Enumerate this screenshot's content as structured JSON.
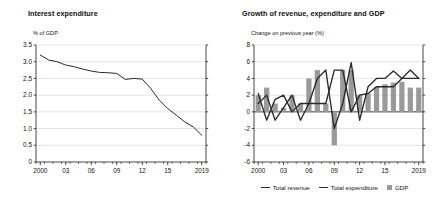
{
  "figure": {
    "background": "#ffffff",
    "line_color": "#2b2b2b",
    "bar_color": "#9a9a9a",
    "grid_color": "#c9c9c9",
    "axis_color": "#1a1a1a"
  },
  "panels": {
    "left": {
      "title": "Interest expenditure",
      "unit_label": "% of GDP"
    },
    "right": {
      "title": "Growth of revenue, expenditure and GDP",
      "unit_label": "Change on previous year (%)",
      "legend": [
        {
          "key": "total-revenue",
          "label": "Total revenue",
          "marker": "line",
          "color": "#2b2b2b"
        },
        {
          "key": "total-expenditure",
          "label": "Total expenditure",
          "marker": "line",
          "color": "#2b2b2b"
        },
        {
          "key": "gdp",
          "label": "GDP",
          "marker": "swatch",
          "color": "#9a9a9a"
        }
      ]
    }
  },
  "chart_data": [
    {
      "type": "line",
      "id": "interest-expenditure",
      "title": "Interest expenditure",
      "xlabel": "",
      "ylabel": "% of GDP",
      "ylim": [
        0,
        3.5
      ],
      "yticks": [
        0,
        0.5,
        1.0,
        1.5,
        2.0,
        2.5,
        3.0,
        3.5
      ],
      "ytick_labels": [
        "0",
        "0.5",
        "1.0",
        "1.5",
        "2.0",
        "2.5",
        "3.0",
        "3.5"
      ],
      "xlim": [
        2000,
        2019
      ],
      "xticks": [
        2000,
        2003,
        2006,
        2009,
        2012,
        2015,
        2019
      ],
      "xtick_labels": [
        "2000",
        "03",
        "06",
        "09",
        "12",
        "15",
        "2019"
      ],
      "grid": true,
      "legend_position": "none",
      "x": [
        2000,
        2001,
        2002,
        2003,
        2004,
        2005,
        2006,
        2007,
        2008,
        2009,
        2010,
        2011,
        2012,
        2013,
        2014,
        2015,
        2016,
        2017,
        2018,
        2019
      ],
      "values": [
        3.2,
        3.05,
        3.0,
        2.9,
        2.85,
        2.78,
        2.72,
        2.68,
        2.67,
        2.65,
        2.47,
        2.5,
        2.48,
        2.2,
        1.85,
        1.6,
        1.4,
        1.2,
        1.05,
        0.8
      ],
      "series": [
        {
          "name": "Interest expenditure",
          "color": "#2b2b2b",
          "values": [
            3.2,
            3.05,
            3.0,
            2.9,
            2.85,
            2.78,
            2.72,
            2.68,
            2.67,
            2.65,
            2.47,
            2.5,
            2.48,
            2.2,
            1.85,
            1.6,
            1.4,
            1.2,
            1.05,
            0.8
          ]
        }
      ]
    },
    {
      "type": "bar",
      "id": "growth-revenue-expenditure-gdp",
      "title": "Growth of revenue, expenditure and GDP",
      "xlabel": "",
      "ylabel": "Change on previous year (%)",
      "ylim": [
        -6,
        8
      ],
      "yticks": [
        -6,
        -4,
        -2,
        0,
        2,
        4,
        6,
        8
      ],
      "ytick_labels": [
        "-6",
        "-4",
        "-2",
        "0",
        "2",
        "4",
        "6",
        "8"
      ],
      "xlim": [
        2000,
        2019
      ],
      "xticks": [
        2000,
        2003,
        2006,
        2009,
        2012,
        2015,
        2019
      ],
      "xtick_labels": [
        "2000",
        "03",
        "06",
        "09",
        "12",
        "15",
        "2019"
      ],
      "categories": [
        2000,
        2001,
        2002,
        2003,
        2004,
        2005,
        2006,
        2007,
        2008,
        2009,
        2010,
        2011,
        2012,
        2013,
        2014,
        2015,
        2016,
        2017,
        2018,
        2019
      ],
      "grid": true,
      "legend_position": "bottom",
      "series": [
        {
          "name": "GDP",
          "type": "bar",
          "color": "#9a9a9a",
          "values": [
            2.0,
            2.9,
            1.0,
            0.5,
            2.0,
            1.0,
            4.0,
            5.0,
            1.0,
            -4.0,
            5.0,
            5.0,
            2.0,
            2.2,
            3.0,
            3.3,
            3.5,
            3.6,
            2.9,
            2.9
          ]
        },
        {
          "name": "Total revenue",
          "type": "line",
          "color": "#2b2b2b",
          "values": [
            1.0,
            2.0,
            -1.0,
            0.5,
            2.0,
            -1.0,
            1.0,
            4.0,
            5.0,
            -2.0,
            1.0,
            5.9,
            -1.0,
            3.0,
            4.0,
            4.0,
            4.9,
            4.0,
            5.0,
            4.0
          ]
        },
        {
          "name": "Total expenditure",
          "type": "line",
          "color": "#2b2b2b",
          "values": [
            2.2,
            -1.0,
            1.5,
            2.0,
            0.0,
            1.0,
            1.0,
            1.0,
            1.0,
            5.0,
            5.0,
            0.0,
            2.0,
            2.2,
            3.0,
            3.0,
            3.0,
            4.0,
            4.0,
            4.0
          ]
        }
      ]
    }
  ]
}
